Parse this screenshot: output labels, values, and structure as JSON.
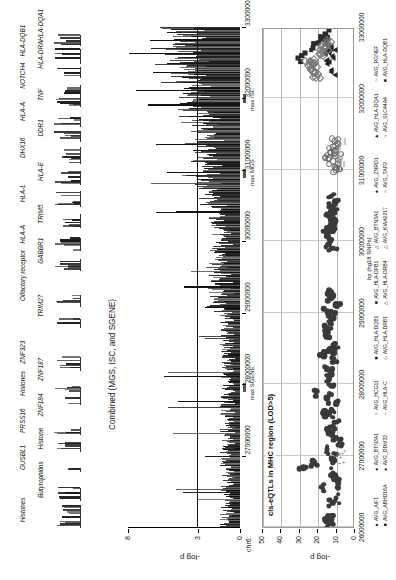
{
  "figure": {
    "chromosome_label": "chr6:",
    "axis_x_ticks": [
      "27000000",
      "28000000",
      "29000000",
      "30000000",
      "31000000",
      "32000000",
      "33000000"
    ],
    "gene_track_labels": [
      "Histones",
      "Butyrophilins",
      "GUSBL1",
      "Histone",
      "PRSS16",
      "ZNF184",
      "Histones",
      "ZNF187",
      "ZNF323",
      "TRIM27",
      "Olfactory receptor",
      "GABBR1",
      "HLA-A",
      "TRIM5",
      "HLA-L",
      "HLA-E",
      "DHX16",
      "DDR1",
      "HLA-A",
      "TNF",
      "NOTCH4",
      "HLA-DRA",
      "HLA-DQB1",
      "HLA-DQA1"
    ]
  },
  "manhattan": {
    "title": "Combined (MGS, ISC, and SGENE)",
    "ylabel": "-log p",
    "y_ticks": [
      "0",
      "3",
      "8"
    ],
    "ylim": [
      0,
      8
    ],
    "threshold_value": "3",
    "annotations": [
      {
        "label": "max SGENE"
      },
      {
        "label": "max MGS"
      },
      {
        "label": "max ISC"
      }
    ]
  },
  "eqtl": {
    "title": "cis-eQTLs in MHC region (LOD>5)",
    "ylabel": "-log p",
    "xlabel": "bp (hg18 SNPs)",
    "y_ticks": [
      "0",
      "10",
      "20",
      "30",
      "40",
      "50"
    ],
    "ylim": [
      0,
      50
    ],
    "legend": [
      {
        "marker": "circleF",
        "label": "AVG_AIF1"
      },
      {
        "marker": "squareF",
        "label": "AVG_ABHD16A"
      },
      {
        "marker": "circleF",
        "label": "AVG_BTN3A1"
      },
      {
        "marker": "circleF",
        "label": "AVG_DDM32"
      },
      {
        "marker": "circleO",
        "label": "AVG_HCG11"
      },
      {
        "marker": "dash",
        "label": "AVG_HLA-C"
      },
      {
        "marker": "squareF",
        "label": "AVG_HLA-DQB1"
      },
      {
        "marker": "diamondO",
        "label": "AVG_HLA-DRB1"
      },
      {
        "marker": "squareF",
        "label": "AVG_HLA-DPB1"
      },
      {
        "marker": "triO",
        "label": "AVG_HLA-DRB4"
      },
      {
        "marker": "triO",
        "label": "AVG_BTN3A1"
      },
      {
        "marker": "triO",
        "label": "AVG_KIAA0317"
      },
      {
        "marker": "circleF",
        "label": "AVG_ZNRD1"
      },
      {
        "marker": "circleO",
        "label": "AVG_TAP2"
      },
      {
        "marker": "triF",
        "label": "AVG_HLA-DQA1"
      },
      {
        "marker": "circleO",
        "label": "AVG_SLC44A4"
      },
      {
        "marker": "circleO",
        "label": "AVG_RGNEF"
      },
      {
        "marker": "squareF",
        "label": "AVG_HLA-DQB1"
      }
    ]
  },
  "chart_data": {
    "type": "scatter",
    "title": "cis-eQTLs in MHC region (LOD>5)",
    "xlabel": "bp (hg18 SNPs)",
    "ylabel": "-log p",
    "xlim": [
      26000000,
      33000000
    ],
    "ylim": [
      0,
      50
    ],
    "xticks": [
      26000000,
      27000000,
      28000000,
      29000000,
      30000000,
      31000000,
      32000000,
      33000000
    ],
    "yticks": [
      0,
      10,
      20,
      30,
      40,
      50
    ],
    "grid": true,
    "legend_position": "below",
    "series": [
      {
        "name": "AVG_AIF1",
        "marker": "circleF",
        "points": [
          [
            26060000,
            13
          ],
          [
            26090000,
            14
          ],
          [
            26110000,
            12
          ],
          [
            26340000,
            11
          ],
          [
            26400000,
            9
          ],
          [
            26560000,
            17
          ],
          [
            26620000,
            8
          ],
          [
            26700000,
            10
          ],
          [
            26760000,
            11
          ],
          [
            26830000,
            27
          ],
          [
            26900000,
            21
          ],
          [
            26960000,
            12
          ],
          [
            27020000,
            9
          ],
          [
            27090000,
            14
          ],
          [
            27160000,
            7
          ],
          [
            27250000,
            9
          ],
          [
            27320000,
            13
          ],
          [
            27400000,
            11
          ],
          [
            27470000,
            10
          ],
          [
            27560000,
            15
          ],
          [
            27640000,
            12
          ],
          [
            27720000,
            9
          ],
          [
            27810000,
            14
          ],
          [
            27900000,
            20
          ],
          [
            27980000,
            11
          ],
          [
            28060000,
            13
          ],
          [
            28140000,
            12
          ],
          [
            28230000,
            14
          ],
          [
            28310000,
            11
          ],
          [
            28400000,
            16
          ],
          [
            28480000,
            12
          ],
          [
            28570000,
            10
          ],
          [
            28660000,
            13
          ],
          [
            28750000,
            15
          ],
          [
            28840000,
            12
          ],
          [
            28930000,
            11
          ],
          [
            29020000,
            14
          ],
          [
            29110000,
            9
          ],
          [
            29200000,
            12
          ],
          [
            29290000,
            13
          ]
        ]
      },
      {
        "name": "AVG_ZNRD1",
        "marker": "circleF",
        "points": [
          [
            29900000,
            11
          ],
          [
            29960000,
            13
          ],
          [
            30020000,
            12
          ],
          [
            30080000,
            14
          ],
          [
            30140000,
            11
          ],
          [
            30210000,
            12
          ],
          [
            30280000,
            10
          ],
          [
            30350000,
            13
          ],
          [
            30420000,
            12
          ],
          [
            30480000,
            11
          ],
          [
            30560000,
            9
          ],
          [
            30630000,
            12
          ]
        ]
      },
      {
        "name": "AVG_HCG11",
        "marker": "circleO",
        "points": [
          [
            31000000,
            9
          ],
          [
            31040000,
            10
          ],
          [
            31080000,
            8
          ],
          [
            31120000,
            11
          ],
          [
            31160000,
            13
          ],
          [
            31200000,
            10
          ],
          [
            31240000,
            12
          ],
          [
            31280000,
            9
          ],
          [
            31320000,
            11
          ],
          [
            31360000,
            8
          ],
          [
            31400000,
            10
          ]
        ]
      },
      {
        "name": "AVG_HLA-C",
        "marker": "dash",
        "points": [
          [
            31100000,
            7
          ],
          [
            31180000,
            6
          ],
          [
            31260000,
            8
          ],
          [
            31340000,
            7
          ]
        ]
      },
      {
        "name": "AVG_HLA-DQA1",
        "marker": "triF",
        "points": [
          [
            32400000,
            12
          ],
          [
            32480000,
            14
          ],
          [
            32560000,
            11
          ],
          [
            32620000,
            15
          ],
          [
            32680000,
            13
          ],
          [
            32740000,
            12
          ],
          [
            32800000,
            16
          ],
          [
            32860000,
            14
          ]
        ]
      },
      {
        "name": "AVG_HLA-DQB1",
        "marker": "squareF",
        "points": [
          [
            32560000,
            30
          ],
          [
            32640000,
            26
          ],
          [
            32700000,
            22
          ],
          [
            32770000,
            19
          ],
          [
            32840000,
            17
          ],
          [
            32900000,
            15
          ],
          [
            32960000,
            13
          ]
        ]
      },
      {
        "name": "AVG_HLA-DRB1",
        "marker": "diamondO",
        "points": [
          [
            32300000,
            20
          ],
          [
            32380000,
            22
          ],
          [
            32460000,
            24
          ],
          [
            32540000,
            21
          ],
          [
            32620000,
            18
          ],
          [
            32700000,
            16
          ],
          [
            32780000,
            14
          ]
        ]
      }
    ]
  }
}
